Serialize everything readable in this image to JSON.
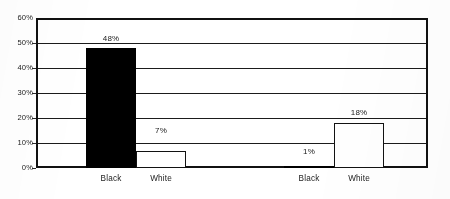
{
  "chart_data": {
    "type": "bar",
    "title": "",
    "subtitle": "",
    "xlabel": "",
    "ylabel": "",
    "categories": [
      "Black",
      "White",
      "Black",
      "White"
    ],
    "values": [
      48,
      7,
      1,
      18
    ],
    "value_labels": [
      "48%",
      "7%",
      "1%",
      "18%"
    ],
    "bar_styles": [
      "filled",
      "hollow",
      "filled",
      "hollow"
    ],
    "groups": [
      {
        "bars": [
          {
            "category": "Black",
            "value": 48,
            "label": "48%",
            "style": "filled"
          },
          {
            "category": "White",
            "value": 7,
            "label": "7%",
            "style": "hollow"
          }
        ]
      },
      {
        "bars": [
          {
            "category": "Black",
            "value": 1,
            "label": "1%",
            "style": "filled"
          },
          {
            "category": "White",
            "value": 18,
            "label": "18%",
            "style": "hollow"
          }
        ]
      }
    ],
    "ylim": [
      0,
      60
    ],
    "ytick_values": [
      0,
      10,
      20,
      30,
      40,
      50,
      60
    ],
    "ytick_labels": [
      "0%",
      "10%",
      "20%",
      "30%",
      "40%",
      "50%",
      "60%"
    ],
    "grid": true,
    "grid_axis": "y",
    "legend": null,
    "legend_position": "none",
    "colors": {
      "filled_bar": "#000000",
      "hollow_bar_fill": "#ffffff",
      "hollow_bar_border": "#121212",
      "axis": "#111111",
      "gridline": "#1b1b1b",
      "text": "#232323",
      "background": "#ffffff"
    }
  }
}
